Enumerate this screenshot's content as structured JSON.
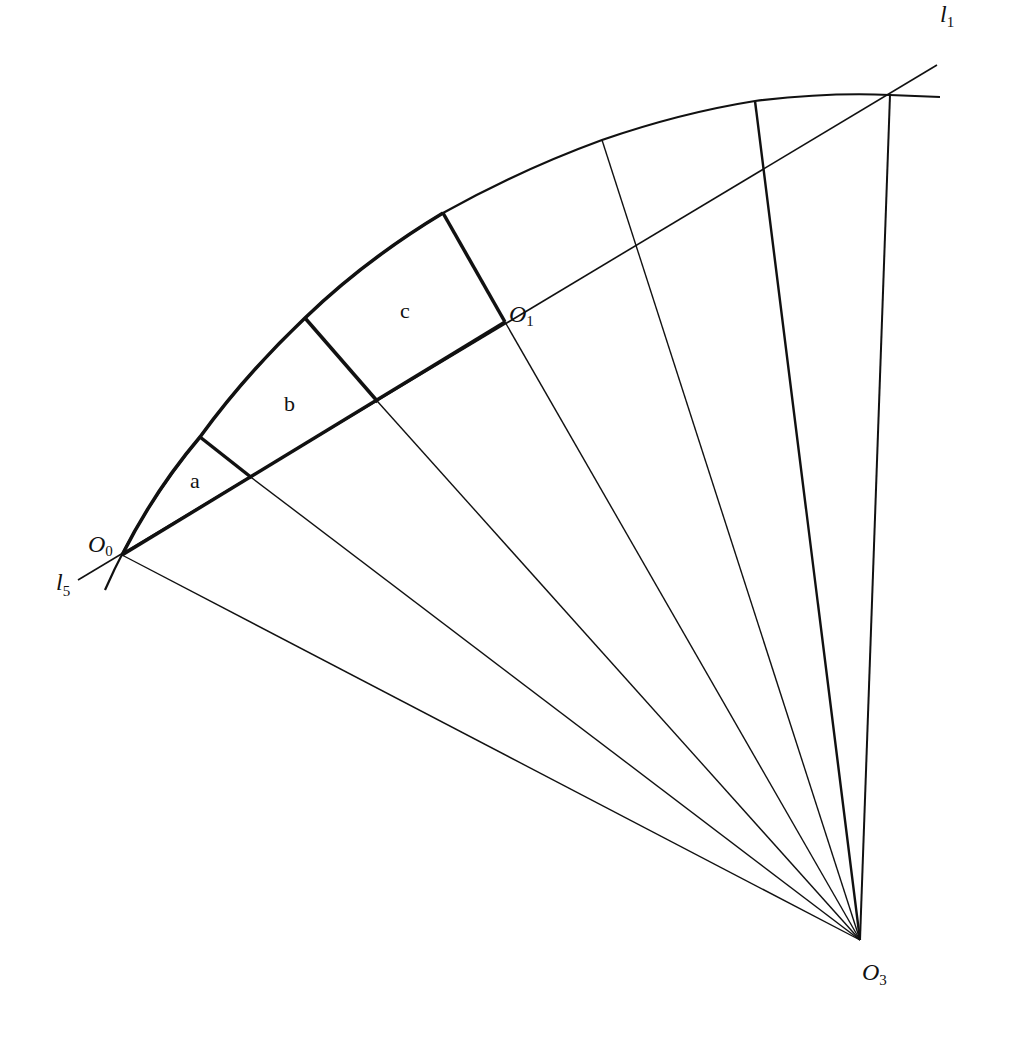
{
  "diagram": {
    "type": "geometric-construction",
    "stroke_color": "#111111",
    "background": "#ffffff",
    "points": {
      "O0": {
        "label": "O",
        "sub": "0",
        "x": 122,
        "y": 555
      },
      "O1": {
        "label": "O",
        "sub": "1",
        "x": 505,
        "y": 322
      },
      "O3": {
        "label": "O",
        "sub": "3",
        "x": 860,
        "y": 940
      }
    },
    "lines": {
      "l1": {
        "label": "l",
        "sub": "1"
      },
      "l5": {
        "label": "l",
        "sub": "5"
      }
    },
    "regions": {
      "a": "a",
      "b": "b",
      "c": "c"
    }
  }
}
